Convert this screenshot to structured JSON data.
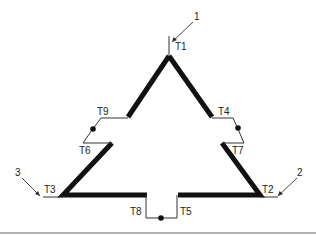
{
  "diagram": {
    "type": "delta-winding-terminal-diagram",
    "leads": [
      {
        "id": "lead-1",
        "label": "1"
      },
      {
        "id": "lead-2",
        "label": "2"
      },
      {
        "id": "lead-3",
        "label": "3"
      }
    ],
    "terminals": [
      {
        "id": "T1",
        "label": "T1"
      },
      {
        "id": "T2",
        "label": "T2"
      },
      {
        "id": "T3",
        "label": "T3"
      },
      {
        "id": "T4",
        "label": "T4"
      },
      {
        "id": "T5",
        "label": "T5"
      },
      {
        "id": "T6",
        "label": "T6"
      },
      {
        "id": "T7",
        "label": "T7"
      },
      {
        "id": "T8",
        "label": "T8"
      },
      {
        "id": "T9",
        "label": "T9"
      }
    ],
    "connections": [
      {
        "from": "T9",
        "to": "T6",
        "junction": true
      },
      {
        "from": "T4",
        "to": "T7",
        "junction": true
      },
      {
        "from": "T8",
        "to": "T5",
        "junction": true
      }
    ],
    "colors": {
      "winding": "#111111",
      "wire": "#333333",
      "rule": "#9a9a9a"
    }
  }
}
